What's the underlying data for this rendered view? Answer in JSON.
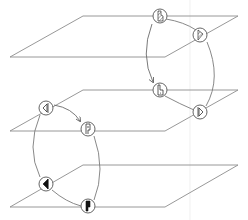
{
  "diagram": {
    "title": "",
    "colors": {
      "background": "#ffffff",
      "plane_stroke": "#8c8c8c",
      "arc_stroke": "#7a7a7a",
      "node_stroke": "#555555",
      "glyph": "#111111"
    },
    "planes": [
      {
        "id": "top",
        "points": "83,16 238,16 165,57 10,57"
      },
      {
        "id": "middle",
        "points": "83,90 238,90 165,131 10,131"
      },
      {
        "id": "bottom",
        "points": "83,165 238,165 165,207 10,207"
      }
    ],
    "nodes": [
      {
        "id": "A",
        "plane": "top",
        "x": 160,
        "y": 16,
        "glyph": "hatched-notched-bar-icon"
      },
      {
        "id": "B",
        "plane": "top",
        "x": 200,
        "y": 35,
        "glyph": "hatched-right-triangle-icon"
      },
      {
        "id": "C",
        "plane": "middle",
        "x": 160,
        "y": 90,
        "glyph": "notched-bar-outline-icon"
      },
      {
        "id": "D",
        "plane": "middle",
        "x": 200,
        "y": 112,
        "glyph": "right-triangle-outline-icon"
      },
      {
        "id": "E",
        "plane": "middle",
        "x": 46,
        "y": 108,
        "glyph": "left-triangle-outline-icon"
      },
      {
        "id": "F",
        "plane": "middle",
        "x": 88,
        "y": 129,
        "glyph": "flag-bar-outline-icon"
      },
      {
        "id": "G",
        "plane": "bottom",
        "x": 46,
        "y": 184,
        "glyph": "left-triangle-filled-icon"
      },
      {
        "id": "H",
        "plane": "bottom",
        "x": 88,
        "y": 206,
        "glyph": "flag-bar-filled-icon"
      }
    ],
    "edges": [
      {
        "from": "A",
        "to": "B",
        "arrow": false
      },
      {
        "from": "A",
        "to": "C",
        "arrow": true
      },
      {
        "from": "C",
        "to": "D",
        "arrow": false
      },
      {
        "from": "B",
        "to": "D",
        "arrow": false
      },
      {
        "from": "E",
        "to": "F",
        "arrow": true
      },
      {
        "from": "E",
        "to": "G",
        "arrow": false
      },
      {
        "from": "F",
        "to": "H",
        "arrow": false
      },
      {
        "from": "G",
        "to": "H",
        "arrow": false
      }
    ]
  }
}
